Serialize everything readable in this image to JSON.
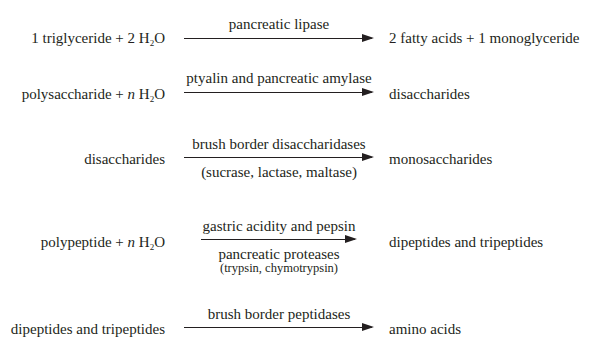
{
  "reactions": [
    {
      "reactants": {
        "pre": "1 triglyceride + 2 H",
        "sub": "2",
        "post": "O"
      },
      "enzyme_above": "pancreatic lipase",
      "products": "2 fatty acids + 1 monoglyceride"
    },
    {
      "reactants": {
        "pre": "polysaccharide + ",
        "italic": "n",
        "mid": " H",
        "sub": "2",
        "post": "O"
      },
      "enzyme_above": "ptyalin and pancreatic amylase",
      "products": "disaccharides"
    },
    {
      "reactants": {
        "pre": "disaccharides"
      },
      "enzyme_above": "brush border disaccharidases",
      "enzyme_below": "(sucrase, lactase, maltase)",
      "products": "monosaccharides"
    },
    {
      "reactants": {
        "pre": "polypeptide + ",
        "italic": "n",
        "mid": " H",
        "sub": "2",
        "post": "O"
      },
      "enzyme_above": "gastric acidity and pepsin",
      "enzyme_below": "pancreatic proteases",
      "enzyme_below_note": "(trypsin, chymotrypsin)",
      "products": "dipeptides and tripeptides"
    },
    {
      "reactants": {
        "pre": "dipeptides and tripeptides"
      },
      "enzyme_above": "brush border peptidases",
      "products": "amino acids"
    }
  ],
  "colors": {
    "ink": "#231f20",
    "background": "#ffffff"
  }
}
